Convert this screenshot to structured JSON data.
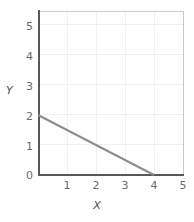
{
  "chart_data": {
    "type": "line",
    "title": "",
    "subtitle": "",
    "xlabel": "X",
    "ylabel": "Y",
    "xlim": [
      0,
      5
    ],
    "ylim": [
      0,
      5.4
    ],
    "xticks": [
      "1",
      "2",
      "3",
      "4",
      "5"
    ],
    "xtick_values": [
      1,
      2,
      3,
      4,
      5
    ],
    "yticks": [
      "5",
      "4",
      "3",
      "2",
      "1",
      "0"
    ],
    "ytick_values": [
      5,
      4,
      3,
      2,
      1,
      0
    ],
    "grid": true,
    "legend": "none",
    "series": [
      {
        "name": "line",
        "x": [
          0,
          4
        ],
        "y": [
          2,
          0
        ],
        "color": "#8c8c8e",
        "slope": -0.5,
        "y_intercept": 2,
        "x_intercept": 4
      }
    ]
  },
  "colors": {
    "axis": "#58585a",
    "frame": "#c9c9c9",
    "grid": "#f0f0f0",
    "line": "#8c8c8e",
    "tick_text": "#6a6a6c",
    "axis_title_text": "#4d4d4f",
    "plot_background": "#ffffff",
    "page_background": "#ffffff"
  }
}
